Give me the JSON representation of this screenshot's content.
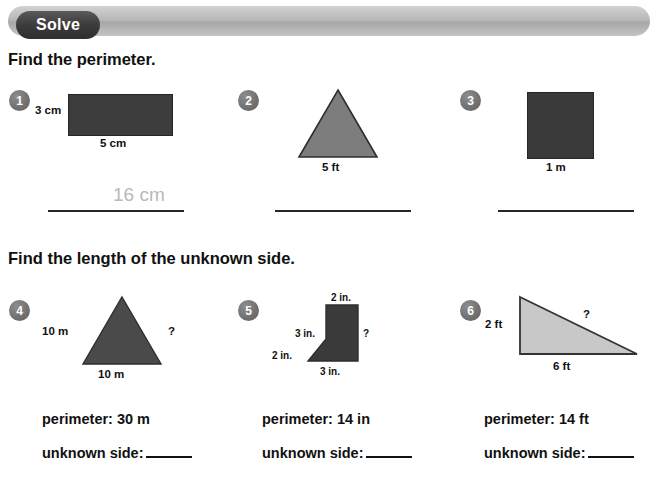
{
  "header": {
    "pill_label": "Solve"
  },
  "sections": [
    {
      "heading": "Find the perimeter."
    },
    {
      "heading": "Find the length of the unknown side."
    }
  ],
  "problems_row1": [
    {
      "number": "1",
      "shape": "rectangle",
      "labels": {
        "left": "3 cm",
        "bottom": "5 cm"
      },
      "written_answer": "16 cm"
    },
    {
      "number": "2",
      "shape": "triangle",
      "labels": {
        "bottom": "5 ft"
      },
      "written_answer": ""
    },
    {
      "number": "3",
      "shape": "square",
      "labels": {
        "bottom": "1 m"
      },
      "written_answer": ""
    }
  ],
  "problems_row2": [
    {
      "number": "4",
      "shape": "triangle",
      "labels": {
        "left": "10 m",
        "right": "?",
        "bottom": "10 m"
      },
      "perimeter": "perimeter: 30 m",
      "unknown_label": "unknown side:"
    },
    {
      "number": "5",
      "shape": "pentagon",
      "labels": {
        "top": "2 in.",
        "left": "3 in.",
        "right": "?",
        "diagonal": "2 in.",
        "bottom": "3 in."
      },
      "perimeter": "perimeter: 14 in",
      "unknown_label": "unknown side:"
    },
    {
      "number": "6",
      "shape": "right-triangle",
      "labels": {
        "left": "2 ft",
        "hypotenuse": "?",
        "bottom": "6 ft"
      },
      "perimeter": "perimeter: 14 ft",
      "unknown_label": "unknown side:"
    }
  ],
  "colors": {
    "shape_dark": "#3c3c3c",
    "shape_medium": "#7d7d7d",
    "shape_light": "#c8c8c8",
    "banner": "#b8b8b8",
    "pill": "#3c3c3c",
    "written_answer": "#b9b9b9"
  }
}
